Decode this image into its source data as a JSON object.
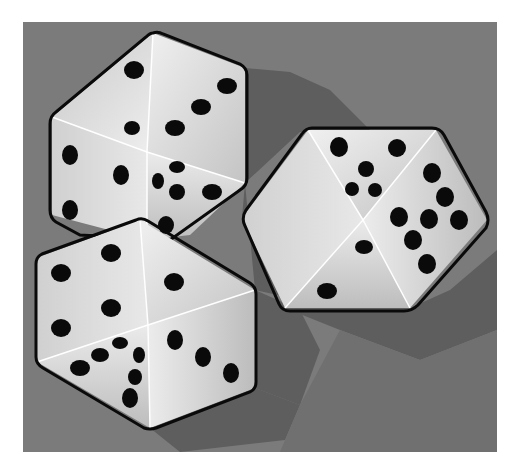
{
  "image": {
    "subject": "Three white dice on a gray background",
    "colors": {
      "page_background": "#ffffff",
      "panel_background": "#7b7b7b",
      "shadow": "#5e5e5e",
      "shadow_light": "#6a6a6a",
      "face_light": "#e6e6e6",
      "face_mid": "#d2d2d2",
      "face_dark": "#bdbdbd",
      "outline": "#0a0a0a",
      "pip": "#0a0a0a"
    }
  },
  "dice": [
    {
      "name": "die-top-left",
      "visible_faces": [
        2,
        5,
        3
      ],
      "faces_desc": [
        "top face shows 2? (pips: 2 + 3 shared)",
        "left face shows 3",
        "right face shows 5"
      ]
    },
    {
      "name": "die-bottom-left",
      "visible_faces": [
        3,
        6,
        3
      ]
    },
    {
      "name": "die-right",
      "visible_faces": [
        5,
        6,
        1,
        1
      ]
    }
  ]
}
